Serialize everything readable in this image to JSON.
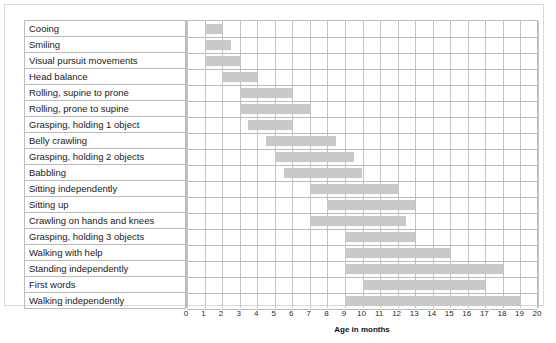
{
  "chart_data": {
    "type": "bar",
    "title": "",
    "subtitle": "",
    "xlabel": "Age in months",
    "ylabel": "",
    "xlim": [
      0,
      20
    ],
    "grid": true,
    "legend": "none",
    "orientation": "horizontal-gantt",
    "xticks": [
      0,
      1,
      2,
      3,
      4,
      5,
      6,
      7,
      8,
      9,
      10,
      11,
      12,
      13,
      14,
      15,
      16,
      17,
      18,
      19,
      20
    ],
    "bar_color": "#c9c9c9",
    "grid_color": "#bcbcbc",
    "categories": [
      "Cooing",
      "Smiling",
      "Visual pursuit movements",
      "Head balance",
      "Rolling, supine to prone",
      "Rolling, prone to supine",
      "Grasping, holding 1 object",
      "Belly crawling",
      "Grasping, holding 2 objects",
      "Babbling",
      "Sitting independently",
      "Sitting up",
      "Crawling on hands and knees",
      "Grasping, holding 3 objects",
      "Walking with help",
      "Standing independently",
      "First words",
      "Walking independently"
    ],
    "ranges": [
      {
        "label": "Cooing",
        "start": 1.0,
        "end": 2.0
      },
      {
        "label": "Smiling",
        "start": 1.0,
        "end": 2.5
      },
      {
        "label": "Visual pursuit movements",
        "start": 1.0,
        "end": 3.0
      },
      {
        "label": "Head balance",
        "start": 2.0,
        "end": 4.0
      },
      {
        "label": "Rolling, supine to prone",
        "start": 3.0,
        "end": 6.0
      },
      {
        "label": "Rolling, prone to supine",
        "start": 3.0,
        "end": 7.0
      },
      {
        "label": "Grasping, holding 1 object",
        "start": 3.5,
        "end": 6.0
      },
      {
        "label": "Belly crawling",
        "start": 4.5,
        "end": 8.5
      },
      {
        "label": "Grasping, holding 2 objects",
        "start": 5.0,
        "end": 9.5
      },
      {
        "label": "Babbling",
        "start": 5.5,
        "end": 10.0
      },
      {
        "label": "Sitting independently",
        "start": 7.0,
        "end": 12.0
      },
      {
        "label": "Sitting up",
        "start": 8.0,
        "end": 13.0
      },
      {
        "label": "Crawling on hands and knees",
        "start": 7.0,
        "end": 12.5
      },
      {
        "label": "Grasping, holding 3 objects",
        "start": 9.0,
        "end": 13.0
      },
      {
        "label": "Walking with help",
        "start": 9.0,
        "end": 15.0
      },
      {
        "label": "Standing independently",
        "start": 9.0,
        "end": 18.0
      },
      {
        "label": "First words",
        "start": 10.0,
        "end": 17.0
      },
      {
        "label": "Walking independently",
        "start": 9.0,
        "end": 19.0
      }
    ]
  }
}
